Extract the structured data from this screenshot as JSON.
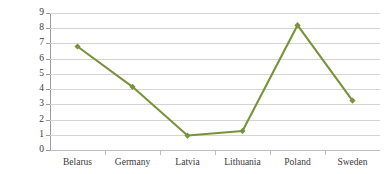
{
  "chart_data": {
    "type": "line",
    "title": "",
    "xlabel": "",
    "ylabel": "",
    "categories": [
      "Belarus",
      "Germany",
      "Latvia",
      "Lithuania",
      "Poland",
      "Sweden"
    ],
    "values": [
      6.8,
      4.15,
      0.95,
      1.25,
      8.2,
      3.25
    ],
    "series": [
      {
        "name": "Series 1",
        "values": [
          6.8,
          4.15,
          0.95,
          1.25,
          8.2,
          3.25
        ]
      }
    ],
    "ylim": [
      0,
      9
    ],
    "ytick_labels": [
      "0",
      "1",
      "2",
      "3",
      "4",
      "5",
      "6",
      "7",
      "8",
      "9"
    ],
    "yticks": [
      0,
      1,
      2,
      3,
      4,
      5,
      6,
      7,
      8,
      9
    ],
    "grid": true,
    "grid_axis": "y",
    "legend": false,
    "legend_position": "none",
    "marker": "diamond",
    "line_color": "#77933C",
    "marker_color": "#77933C",
    "gridline_color": "#D4D4D4",
    "axis_color": "#9A9A9A",
    "background_color": "#FFFFFF",
    "text_color": "#3A3A3A"
  }
}
